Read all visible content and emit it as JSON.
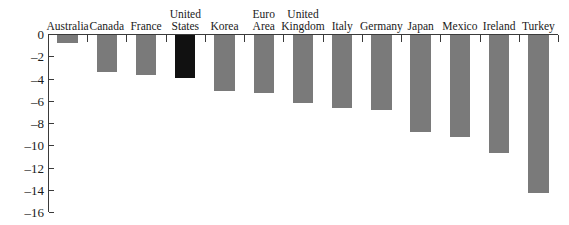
{
  "chart_data": {
    "type": "bar",
    "title": "",
    "subtitle": "",
    "xlabel": "",
    "ylabel": "",
    "orientation": "vertical",
    "grid": false,
    "legend": false,
    "ylim": [
      -16,
      0
    ],
    "ytick_step": 2,
    "ytick_labels": [
      "0",
      "–2",
      "–4",
      "–6",
      "–8",
      "–10",
      "–12",
      "–14",
      "–16"
    ],
    "ytick_values": [
      0,
      -2,
      -4,
      -6,
      -8,
      -10,
      -12,
      -14,
      -16
    ],
    "categories": [
      "Australia",
      "Canada",
      "France",
      "United\nStates",
      "Korea",
      "Euro\nArea",
      "United\nKingdom",
      "Italy",
      "Germany",
      "Japan",
      "Mexico",
      "Ireland",
      "Turkey"
    ],
    "values": [
      -0.7,
      -3.3,
      -3.6,
      -3.85,
      -5.0,
      -5.2,
      -6.1,
      -6.6,
      -6.75,
      -8.7,
      -9.2,
      -10.6,
      -14.2
    ],
    "highlight_category": "United\nStates",
    "colors": {
      "bar": "#7a7a7a",
      "bar_highlight": "#111111",
      "axis": "#3a3a3a",
      "text": "#1a1a1a",
      "background": "#ffffff"
    }
  }
}
